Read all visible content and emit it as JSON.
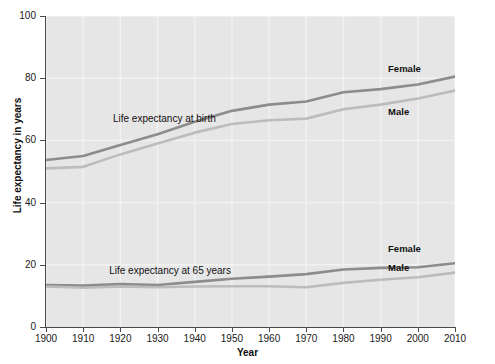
{
  "chart_data": {
    "type": "line",
    "title": "",
    "xlabel": "Year",
    "ylabel": "Life expectancy in years",
    "xlim": [
      1900,
      2010
    ],
    "ylim": [
      0,
      100
    ],
    "grid": true,
    "legend_position": "inline-annotations",
    "x_ticks": [
      "1900",
      "1910",
      "1920",
      "1930",
      "1940",
      "1950",
      "1960",
      "1970",
      "1980",
      "1990",
      "2000",
      "2010"
    ],
    "y_ticks": [
      "0",
      "20",
      "40",
      "60",
      "80",
      "100"
    ],
    "annotations": [
      {
        "text": "Life expectancy at birth",
        "x": 1918,
        "y": 67
      },
      {
        "text": "Life expectancy at 65 years",
        "x": 1917,
        "y": 18
      }
    ],
    "x": [
      1900,
      1910,
      1920,
      1930,
      1940,
      1950,
      1960,
      1970,
      1980,
      1990,
      2000,
      2010
    ],
    "series": [
      {
        "name": "Female",
        "group": "Life expectancy at birth",
        "label_text": "Female",
        "label_x": 1992,
        "label_y": 83,
        "color": "#8c8c8c",
        "values": [
          53.7,
          55.0,
          58.5,
          62.0,
          66.0,
          69.5,
          71.5,
          72.5,
          75.5,
          76.5,
          78.0,
          80.5
        ]
      },
      {
        "name": "Male",
        "group": "Life expectancy at birth",
        "label_text": "Male",
        "label_x": 1992,
        "label_y": 69,
        "color": "#bcbcbc",
        "values": [
          51.0,
          51.5,
          55.5,
          59.0,
          62.5,
          65.3,
          66.5,
          67.0,
          70.0,
          71.5,
          73.5,
          76.0
        ]
      },
      {
        "name": "Female",
        "group": "Life expectancy at 65 years",
        "label_text": "Female",
        "label_x": 1992,
        "label_y": 25,
        "color": "#8c8c8c",
        "values": [
          13.5,
          13.3,
          13.8,
          13.5,
          14.5,
          15.5,
          16.2,
          17.0,
          18.5,
          19.0,
          19.2,
          20.5
        ]
      },
      {
        "name": "Male",
        "group": "Life expectancy at 65 years",
        "label_text": "Male",
        "label_x": 1992,
        "label_y": 19,
        "color": "#bcbcbc",
        "values": [
          13.0,
          12.6,
          13.0,
          12.8,
          13.0,
          13.1,
          13.1,
          12.8,
          14.2,
          15.2,
          16.0,
          17.5
        ]
      }
    ]
  },
  "colors": {
    "plot_background": "#e6e6e6",
    "gridline": "#f2f2f2",
    "axis": "#4a4a4a",
    "female_line": "#8c8c8c",
    "male_line": "#bcbcbc",
    "text": "#111111"
  }
}
